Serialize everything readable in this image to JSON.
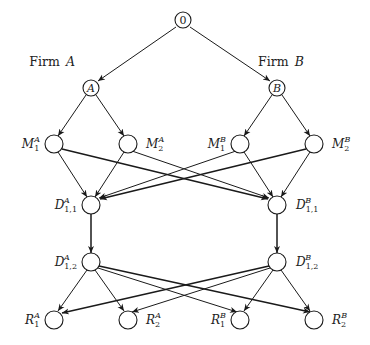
{
  "diagram": {
    "root": {
      "label": "0"
    },
    "firms": [
      {
        "label_prefix": "Firm",
        "label_var": "A",
        "node": "A"
      },
      {
        "label_prefix": "Firm",
        "label_var": "B",
        "node": "B"
      }
    ],
    "levels": {
      "M": [
        {
          "base": "M",
          "sub": "1",
          "sup": "A"
        },
        {
          "base": "M",
          "sub": "2",
          "sup": "A"
        },
        {
          "base": "M",
          "sub": "1",
          "sup": "B"
        },
        {
          "base": "M",
          "sub": "2",
          "sup": "B"
        }
      ],
      "D1": [
        {
          "base": "D",
          "sub": "1,1",
          "sup": "A"
        },
        {
          "base": "D",
          "sub": "1,1",
          "sup": "B"
        }
      ],
      "D2": [
        {
          "base": "D",
          "sub": "1,2",
          "sup": "A"
        },
        {
          "base": "D",
          "sub": "1,2",
          "sup": "B"
        }
      ],
      "R": [
        {
          "base": "R",
          "sub": "1",
          "sup": "A"
        },
        {
          "base": "R",
          "sub": "2",
          "sup": "A"
        },
        {
          "base": "R",
          "sub": "1",
          "sup": "B"
        },
        {
          "base": "R",
          "sub": "2",
          "sup": "B"
        }
      ]
    }
  }
}
